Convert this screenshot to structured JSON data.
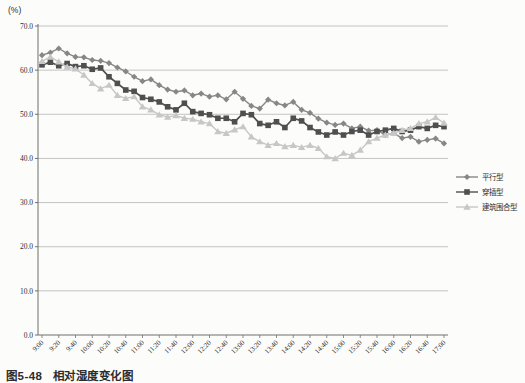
{
  "page": {
    "unit_label": "(%)",
    "caption_figure_no": "图5-48",
    "caption_title": "相对湿度变化图"
  },
  "chart_data": {
    "type": "line",
    "title": "",
    "ylabel": "(%)",
    "xlabel": "",
    "ylim": [
      0,
      70
    ],
    "ytick_step": 10,
    "y_ticks": [
      "0.0",
      "10.0",
      "20.0",
      "30.0",
      "40.0",
      "50.0",
      "60.0",
      "70.0"
    ],
    "grid": "horizontal",
    "legend_position": "right-middle",
    "x_tick_labels": [
      "9:00",
      "9:20",
      "9:40",
      "10:00",
      "10:20",
      "10:40",
      "11:00",
      "11:20",
      "11:40",
      "12:00",
      "12:20",
      "12:40",
      "13:00",
      "13:20",
      "13:40",
      "14:00",
      "14:20",
      "14:40",
      "15:00",
      "15:20",
      "15:40",
      "16:00",
      "16:20",
      "16:40",
      "17:00"
    ],
    "sample_times": [
      "9:00",
      "9:10",
      "9:20",
      "9:30",
      "9:40",
      "9:50",
      "10:00",
      "10:10",
      "10:20",
      "10:30",
      "10:40",
      "10:50",
      "11:00",
      "11:10",
      "11:20",
      "11:30",
      "11:40",
      "11:50",
      "12:00",
      "12:10",
      "12:20",
      "12:30",
      "12:40",
      "12:50",
      "13:00",
      "13:10",
      "13:20",
      "13:30",
      "13:40",
      "13:50",
      "14:00",
      "14:10",
      "14:20",
      "14:30",
      "14:40",
      "14:50",
      "15:00",
      "15:10",
      "15:20",
      "15:30",
      "15:40",
      "15:50",
      "16:00",
      "16:10",
      "16:20",
      "16:30",
      "16:40",
      "16:50",
      "17:00"
    ],
    "colors": {
      "grid": "#b5b5b5",
      "axis": "#6f6f6f",
      "tick_text": "#2f2f2f"
    },
    "series": [
      {
        "name": "平行型",
        "marker": "diamond",
        "color": "#878787",
        "values": [
          63.4,
          64.0,
          64.9,
          63.8,
          63.0,
          62.9,
          62.3,
          62.1,
          61.6,
          60.6,
          59.7,
          58.5,
          57.5,
          57.9,
          56.6,
          55.6,
          55.1,
          55.4,
          54.3,
          54.7,
          54.0,
          54.3,
          53.4,
          55.1,
          53.5,
          51.9,
          51.3,
          53.3,
          52.5,
          52.0,
          52.8,
          51.0,
          50.3,
          49.0,
          48.1,
          47.6,
          47.9,
          46.8,
          47.2,
          46.3,
          46.4,
          45.3,
          45.7,
          44.6,
          44.9,
          43.8,
          44.2,
          44.5,
          43.4
        ]
      },
      {
        "name": "穿插型",
        "marker": "square",
        "color": "#4f4f4f",
        "values": [
          61.2,
          61.8,
          61.0,
          61.5,
          60.8,
          61.0,
          60.2,
          60.5,
          58.5,
          57.0,
          55.5,
          55.2,
          53.8,
          53.4,
          52.8,
          51.7,
          51.0,
          52.5,
          50.6,
          50.2,
          49.9,
          49.1,
          49.1,
          48.3,
          50.2,
          49.9,
          47.9,
          47.5,
          48.3,
          47.0,
          49.1,
          48.5,
          47.0,
          46.0,
          45.3,
          46.0,
          45.3,
          46.1,
          46.4,
          45.3,
          46.1,
          46.4,
          46.8,
          46.1,
          46.4,
          47.2,
          46.8,
          47.5,
          47.2
        ]
      },
      {
        "name": "建筑围合型",
        "marker": "triangle",
        "color": "#c7c7c7",
        "values": [
          62.0,
          63.0,
          61.9,
          60.7,
          60.3,
          58.9,
          57.0,
          55.8,
          56.6,
          54.3,
          53.6,
          54.0,
          51.7,
          51.0,
          49.9,
          49.4,
          49.7,
          49.1,
          48.9,
          48.3,
          47.9,
          46.1,
          45.7,
          46.5,
          47.2,
          44.9,
          43.8,
          43.0,
          43.4,
          42.7,
          43.0,
          42.5,
          43.0,
          42.3,
          40.4,
          40.0,
          41.2,
          40.7,
          41.9,
          43.8,
          44.6,
          45.3,
          45.7,
          46.4,
          46.8,
          47.9,
          48.3,
          49.3,
          48.0
        ]
      }
    ]
  }
}
